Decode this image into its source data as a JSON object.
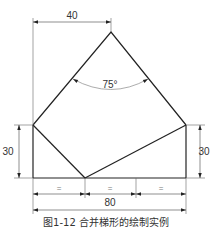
{
  "drawing": {
    "dimensions": {
      "top_width": "40",
      "apex_angle": "75°",
      "left_height": "30",
      "right_height": "30",
      "equal_1": "=",
      "equal_2": "=",
      "equal_3": "=",
      "total_width": "80"
    },
    "colors": {
      "outline": "#222222",
      "dimension": "#555555",
      "arc": "#888888"
    }
  },
  "caption": "图1-12  合并梯形的绘制实例"
}
